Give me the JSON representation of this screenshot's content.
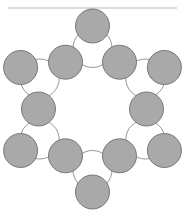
{
  "figure": {
    "canvas": {
      "width": 185,
      "height": 217,
      "background": "#ffffff"
    },
    "rule": {
      "name": "top-horizontal-rule",
      "x1": 8,
      "y1": 8,
      "x2": 177,
      "y2": 8,
      "color": "#b9b9b9",
      "width": 1.1
    },
    "style": {
      "big_fill": "#ffffff",
      "big_stroke": "#8a8a8a",
      "small_fill": "#a9a9a9",
      "small_stroke": "#6e6e6e",
      "stroke_width": 0.9
    },
    "ring": {
      "center_x": 92.5,
      "center_y": 109,
      "big_radius": 19.5,
      "big_ring_radius": 61,
      "small_radius": 17,
      "small_outer_ring_radius": 83,
      "small_junction_ring_radius": 54,
      "big_count": 6,
      "small_outer_count": 6,
      "small_junction_count": 6
    },
    "big_circles": [
      {
        "name": "big-circle-top",
        "cx": 92.5,
        "cy": 48,
        "r": 19.5
      },
      {
        "name": "big-circle-upper-right",
        "cx": 145.3,
        "cy": 78.5,
        "r": 19.5
      },
      {
        "name": "big-circle-lower-right",
        "cx": 145.3,
        "cy": 139.5,
        "r": 19.5
      },
      {
        "name": "big-circle-bottom",
        "cx": 92.5,
        "cy": 170,
        "r": 19.5
      },
      {
        "name": "big-circle-lower-left",
        "cx": 39.7,
        "cy": 139.5,
        "r": 19.5
      },
      {
        "name": "big-circle-upper-left",
        "cx": 39.7,
        "cy": 78.5,
        "r": 19.5
      }
    ],
    "small_circles_outer": [
      {
        "name": "small-circle-top",
        "cx": 92.5,
        "cy": 26,
        "r": 17
      },
      {
        "name": "small-circle-right-upper",
        "cx": 164.4,
        "cy": 67.5,
        "r": 17
      },
      {
        "name": "small-circle-right-lower",
        "cx": 164.4,
        "cy": 150.5,
        "r": 17
      },
      {
        "name": "small-circle-bottom",
        "cx": 92.5,
        "cy": 192,
        "r": 17
      },
      {
        "name": "small-circle-left-lower",
        "cx": 20.6,
        "cy": 150.5,
        "r": 17
      },
      {
        "name": "small-circle-left-upper",
        "cx": 20.6,
        "cy": 67.5,
        "r": 17
      }
    ],
    "small_circles_junction": [
      {
        "name": "small-circle-junction-upper-right",
        "cx": 119.5,
        "cy": 62.2,
        "r": 17
      },
      {
        "name": "small-circle-junction-right",
        "cx": 146.5,
        "cy": 109,
        "r": 17
      },
      {
        "name": "small-circle-junction-lower-right",
        "cx": 119.5,
        "cy": 155.8,
        "r": 17
      },
      {
        "name": "small-circle-junction-lower-left",
        "cx": 65.5,
        "cy": 155.8,
        "r": 17
      },
      {
        "name": "small-circle-junction-left",
        "cx": 38.5,
        "cy": 109,
        "r": 17
      },
      {
        "name": "small-circle-junction-upper-left",
        "cx": 65.5,
        "cy": 62.2,
        "r": 17
      }
    ]
  }
}
